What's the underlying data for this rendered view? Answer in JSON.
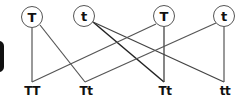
{
  "diagram": {
    "type": "genetic-cross",
    "parents": [
      {
        "id": "p1",
        "label": "T",
        "x": 32,
        "y": 17
      },
      {
        "id": "p2",
        "label": "t",
        "x": 84,
        "y": 16
      },
      {
        "id": "p3",
        "label": "T",
        "x": 164,
        "y": 16
      },
      {
        "id": "p4",
        "label": "t",
        "x": 224,
        "y": 16
      }
    ],
    "offspring": [
      {
        "id": "o1",
        "label": "TT",
        "x": 32,
        "y": 82
      },
      {
        "id": "o2",
        "label": "Tt",
        "x": 85,
        "y": 82
      },
      {
        "id": "o3",
        "label": "Tt",
        "x": 164,
        "y": 82
      },
      {
        "id": "o4",
        "label": "tt",
        "x": 224,
        "y": 82
      }
    ],
    "connections": [
      {
        "from": "p1",
        "to": "o1"
      },
      {
        "from": "p1",
        "to": "o2"
      },
      {
        "from": "p2",
        "to": "o3"
      },
      {
        "from": "p2",
        "to": "o4"
      },
      {
        "from": "p3",
        "to": "o1"
      },
      {
        "from": "p3",
        "to": "o3"
      },
      {
        "from": "p4",
        "to": "o2"
      },
      {
        "from": "p4",
        "to": "o4"
      }
    ],
    "line_color": "#555555"
  }
}
